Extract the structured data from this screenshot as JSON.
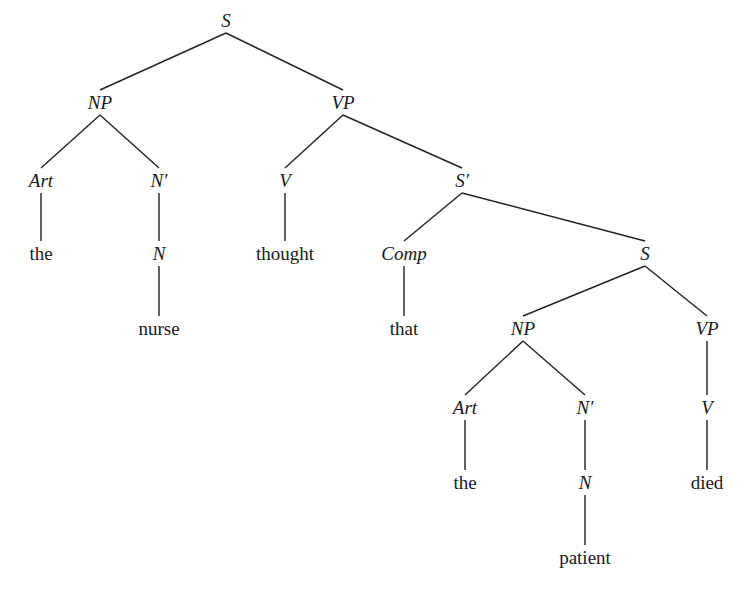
{
  "diagram": {
    "type": "syntax-tree",
    "sentence": "the nurse thought that the patient died",
    "nodes": [
      {
        "id": "s1",
        "label": "S",
        "kind": "cat",
        "x": 226,
        "y": 20
      },
      {
        "id": "np1",
        "label": "NP",
        "kind": "cat",
        "x": 100,
        "y": 102
      },
      {
        "id": "vp1",
        "label": "VP",
        "kind": "cat",
        "x": 343,
        "y": 102
      },
      {
        "id": "art1",
        "label": "Art",
        "kind": "cat",
        "x": 41,
        "y": 180
      },
      {
        "id": "nbar1",
        "label": "N′",
        "kind": "cat",
        "x": 159,
        "y": 180
      },
      {
        "id": "v1",
        "label": "V",
        "kind": "cat",
        "x": 285,
        "y": 180
      },
      {
        "id": "sbar",
        "label": "S′",
        "kind": "cat",
        "x": 462,
        "y": 180
      },
      {
        "id": "the1",
        "label": "the",
        "kind": "word",
        "x": 41,
        "y": 253
      },
      {
        "id": "n1",
        "label": "N",
        "kind": "cat",
        "x": 159,
        "y": 253
      },
      {
        "id": "thought",
        "label": "thought",
        "kind": "word",
        "x": 285,
        "y": 253
      },
      {
        "id": "comp",
        "label": "Comp",
        "kind": "cat",
        "x": 404,
        "y": 253
      },
      {
        "id": "s2",
        "label": "S",
        "kind": "cat",
        "x": 645,
        "y": 253
      },
      {
        "id": "nurse",
        "label": "nurse",
        "kind": "word",
        "x": 159,
        "y": 328
      },
      {
        "id": "that",
        "label": "that",
        "kind": "word",
        "x": 404,
        "y": 328
      },
      {
        "id": "np2",
        "label": "NP",
        "kind": "cat",
        "x": 523,
        "y": 328
      },
      {
        "id": "vp2",
        "label": "VP",
        "kind": "cat",
        "x": 707,
        "y": 328
      },
      {
        "id": "art2",
        "label": "Art",
        "kind": "cat",
        "x": 465,
        "y": 407
      },
      {
        "id": "nbar2",
        "label": "N′",
        "kind": "cat",
        "x": 585,
        "y": 407
      },
      {
        "id": "v2",
        "label": "V",
        "kind": "cat",
        "x": 707,
        "y": 407
      },
      {
        "id": "the2",
        "label": "the",
        "kind": "word",
        "x": 465,
        "y": 482
      },
      {
        "id": "n2",
        "label": "N",
        "kind": "cat",
        "x": 585,
        "y": 482
      },
      {
        "id": "died",
        "label": "died",
        "kind": "word",
        "x": 707,
        "y": 482
      },
      {
        "id": "patient",
        "label": "patient",
        "kind": "word",
        "x": 585,
        "y": 557
      }
    ],
    "edges": [
      [
        "s1",
        "np1"
      ],
      [
        "s1",
        "vp1"
      ],
      [
        "np1",
        "art1"
      ],
      [
        "np1",
        "nbar1"
      ],
      [
        "vp1",
        "v1"
      ],
      [
        "vp1",
        "sbar"
      ],
      [
        "art1",
        "the1"
      ],
      [
        "nbar1",
        "n1"
      ],
      [
        "n1",
        "nurse"
      ],
      [
        "v1",
        "thought"
      ],
      [
        "sbar",
        "comp"
      ],
      [
        "sbar",
        "s2"
      ],
      [
        "comp",
        "that"
      ],
      [
        "s2",
        "np2"
      ],
      [
        "s2",
        "vp2"
      ],
      [
        "np2",
        "art2"
      ],
      [
        "np2",
        "nbar2"
      ],
      [
        "vp2",
        "v2"
      ],
      [
        "art2",
        "the2"
      ],
      [
        "nbar2",
        "n2"
      ],
      [
        "n2",
        "patient"
      ],
      [
        "v2",
        "died"
      ]
    ]
  }
}
